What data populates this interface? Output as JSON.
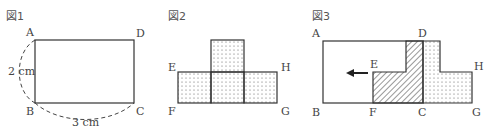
{
  "figures": [
    {
      "title": "図1",
      "labels": {
        "A": "A",
        "B": "B",
        "C": "C",
        "D": "D"
      },
      "dimensions": {
        "height": "2 cm",
        "width": "3 cm"
      }
    },
    {
      "title": "図2",
      "labels": {
        "E": "E",
        "F": "F",
        "G": "G",
        "H": "H"
      }
    },
    {
      "title": "図3",
      "labels": {
        "A": "A",
        "B": "B",
        "C": "C",
        "D": "D",
        "E": "E",
        "F": "F",
        "G": "G",
        "H": "H"
      }
    }
  ],
  "colors": {
    "line": "#333333",
    "dots": "#555555",
    "hatch": "#333333",
    "dash": "#444444",
    "arrow": "#222222"
  }
}
